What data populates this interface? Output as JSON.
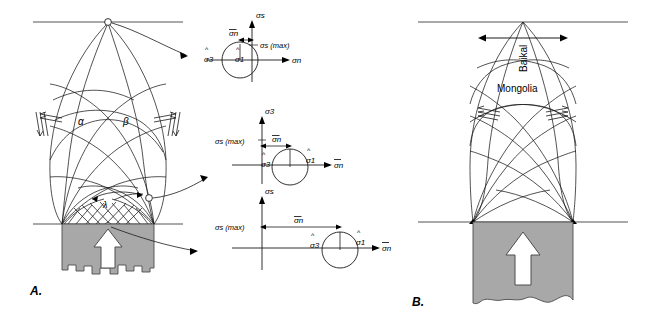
{
  "figure": {
    "panels": [
      {
        "id": "A",
        "label": "A.",
        "name": "slip-line-field-model",
        "annotations": [
          {
            "key": "alpha",
            "text": "α"
          },
          {
            "key": "beta",
            "text": "β"
          },
          {
            "key": "lambda",
            "text": "λ"
          }
        ]
      },
      {
        "id": "B",
        "label": "B.",
        "name": "baikal-mongolia-application",
        "annotations": [
          {
            "key": "baikal",
            "text": "Baikal"
          },
          {
            "key": "mongolia",
            "text": "Mongolia"
          }
        ]
      }
    ],
    "mohr_diagrams": [
      {
        "id": "top",
        "name": "mohr-circle-top",
        "vertical_axis_label": "σs",
        "horizontal_axis_label": "σn",
        "sigma_s_max_label": "σs (max)",
        "sigma_n_bar_label": "σn",
        "sigma_3_hat_label": "σ3",
        "sigma_1_hat_label": "σ1",
        "position": "tensile",
        "description": "Mohr circle straddling origin, mean stress near zero"
      },
      {
        "id": "middle",
        "name": "mohr-circle-middle",
        "vertical_axis_label": "σ3",
        "horizontal_axis_label": "σn",
        "sigma_s_max_label": "σs (max)",
        "sigma_n_bar_label": "σn",
        "sigma_3_hat_label": "σ3",
        "sigma_1_hat_label": "σ1",
        "position": "intermediate",
        "description": "Mohr circle shifted to positive mean stress"
      },
      {
        "id": "bottom",
        "name": "mohr-circle-bottom",
        "vertical_axis_label": "σs",
        "horizontal_axis_label": "σn",
        "sigma_s_max_label": "σs (max)",
        "sigma_n_bar_label": "σn",
        "sigma_3_hat_label": "σ3",
        "sigma_1_hat_label": "σ1",
        "position": "compressive",
        "description": "Mohr circle far in compressive field, large mean stress"
      }
    ],
    "colors": {
      "line": "#000000",
      "stroke_thin": "#1a1a1a",
      "indenter_fill": "#a8a8a8",
      "indenter_stroke": "#4d4d4d",
      "arrow_fill": "#ffffff",
      "background": "#ffffff"
    }
  }
}
